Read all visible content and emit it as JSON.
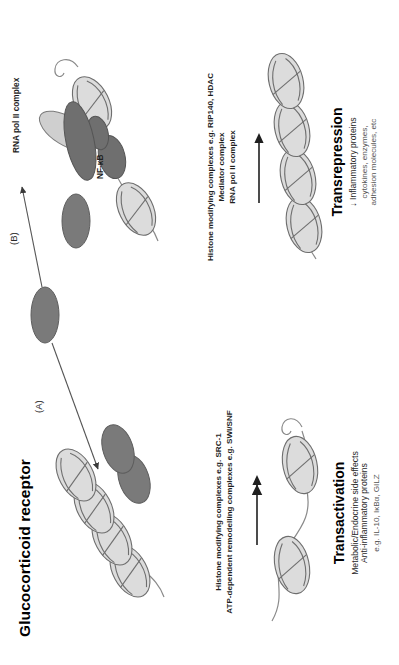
{
  "figure": {
    "title": "Glucocorticoid receptor",
    "orientation_deg": -90
  },
  "panels": [
    {
      "id": "A",
      "label": "(A)"
    },
    {
      "id": "B",
      "label": "(B)"
    }
  ],
  "pathway_a": {
    "panel_label": "(A)",
    "cofactors": [
      "Histone modifying complexes e.g. SRC-1",
      "ATP-dependent remodelling complexes e.g. SWI/SNF"
    ],
    "outcome_title": "Transactivation",
    "outcome_lines": [
      "Metabolic/Endocrine side effects",
      "Anti-inflammatory proteins"
    ],
    "outcome_examples": "e.g. IL-10, IκBα, GILZ"
  },
  "pathway_b": {
    "panel_label": "(B)",
    "factor_labels": [
      "RNA pol II complex",
      "NF-κB"
    ],
    "cofactors": [
      "Histone modifying complexes e.g. RIP140, HDAC",
      "Mediator complex",
      "RNA pol II complex"
    ],
    "outcome_title": "Transrepression",
    "outcome_lines": [
      "↓ Inflammatory proteins"
    ],
    "outcome_examples_1": "cytokines, enzymes,",
    "outcome_examples_2": "adhesion molecules, etc"
  },
  "colors": {
    "receptor_fill": "#7a7a7a",
    "receptor_stroke": "#5a5a5a",
    "nucleosome_fill": "#d8d8d8",
    "nucleosome_stroke": "#6e6e6e",
    "polymerase_fill": "#c9c9c9",
    "dna_stroke": "#808080",
    "arrow": "#3a3a3a",
    "text": "#1a1a1a"
  },
  "icons": {
    "receptor": "gr-receptor-ellipse",
    "nucleosome": "nucleosome-icon",
    "polymerase": "rna-pol-ii-icon",
    "arrow": "arrow-right-icon"
  }
}
